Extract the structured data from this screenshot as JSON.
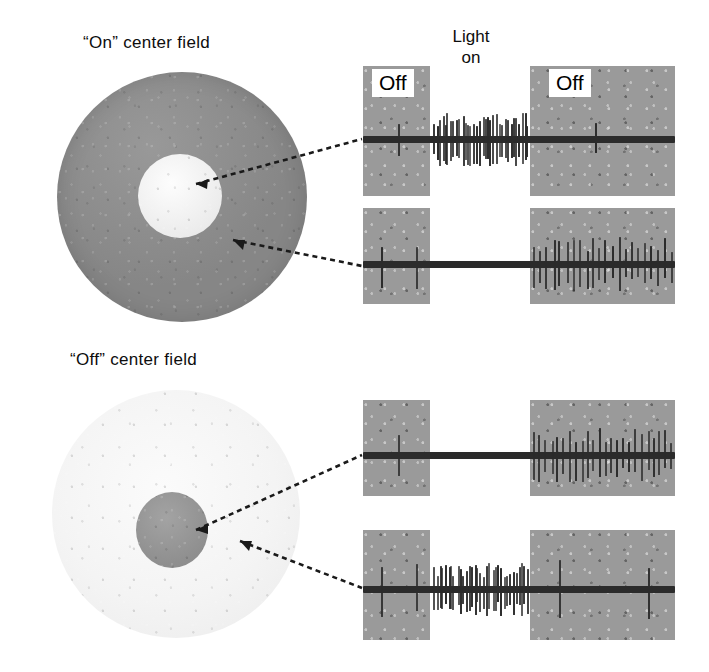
{
  "figure": {
    "labels": {
      "on_center_field": "“On” center field",
      "off_center_field": "“Off” center field",
      "light_line1": "Light",
      "light_line2": "on",
      "off_left": "Off",
      "off_right": "Off"
    },
    "colors": {
      "background": "#ffffff",
      "text": "#0d0d0d",
      "dark_surround": "#8d8d8d",
      "light_center": "#f2f2f2",
      "light_surround": "#f4f4f4",
      "gray_center": "#8f8f8f",
      "panel_gray": "#9a9a9a",
      "trace_ink": "#2b2b2b"
    },
    "diagrams": [
      {
        "name": "on-center-field",
        "title": "“On” center field",
        "surround_tone": "dark",
        "center_tone": "light"
      },
      {
        "name": "off-center-field",
        "title": "“Off” center field",
        "surround_tone": "light",
        "center_tone": "dark"
      }
    ]
  },
  "chart_data": {
    "type": "line",
    "xlabel": "Time",
    "ylabel": "Extracellular spike activity",
    "grid": false,
    "legend": "none",
    "stimulus_epochs": [
      {
        "label": "Off",
        "region": "left",
        "shading": "gray"
      },
      {
        "label": "Light on",
        "region": "center",
        "shading": "white"
      },
      {
        "label": "Off",
        "region": "right",
        "shading": "gray"
      }
    ],
    "series": [
      {
        "name": "On-center field, center stimulated",
        "field": "on-center-field",
        "region": "center",
        "epoch_firing": {
          "before_light": "low",
          "light_on": "high",
          "after_light": "low"
        },
        "spike_counts": {
          "before_light": 1,
          "light_on": 34,
          "after_light": 1
        },
        "description": "Vigorous maintained discharge during light on"
      },
      {
        "name": "On-center field, surround stimulated",
        "field": "on-center-field",
        "region": "surround",
        "epoch_firing": {
          "before_light": "low",
          "light_on": "silent",
          "after_light": "high"
        },
        "spike_counts": {
          "before_light": 2,
          "light_on": 0,
          "after_light": 22
        },
        "description": "Silenced during light on, off-discharge after light off"
      },
      {
        "name": "Off-center field, center stimulated",
        "field": "off-center-field",
        "region": "center",
        "epoch_firing": {
          "before_light": "low",
          "light_on": "silent",
          "after_light": "high"
        },
        "spike_counts": {
          "before_light": 1,
          "light_on": 0,
          "after_light": 24
        },
        "description": "Suppressed by light, bursts at light off"
      },
      {
        "name": "Off-center field, surround stimulated",
        "field": "off-center-field",
        "region": "surround",
        "epoch_firing": {
          "before_light": "low",
          "light_on": "high",
          "after_light": "low"
        },
        "spike_counts": {
          "before_light": 2,
          "light_on": 33,
          "after_light": 2
        },
        "description": "Discharges throughout light on"
      }
    ]
  }
}
